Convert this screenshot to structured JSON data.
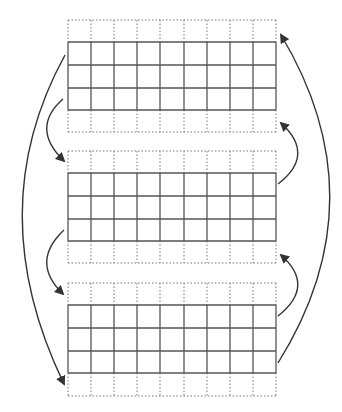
{
  "diagram": {
    "width": 342,
    "height": 412,
    "colors": {
      "background": "#ffffff",
      "solid_line": "#555555",
      "dotted_line": "#777777",
      "arrow": "#333333"
    },
    "grid_columns_x": [
      68,
      91,
      114,
      137,
      160,
      184,
      207,
      230,
      253,
      276
    ],
    "grids": [
      {
        "id": "grid-top",
        "dotted_top": 20,
        "solid_rows_y": [
          42,
          65,
          88,
          110
        ],
        "dotted_bottom": 132
      },
      {
        "id": "grid-middle",
        "dotted_top": 151,
        "solid_rows_y": [
          173,
          196,
          219,
          241
        ],
        "dotted_bottom": 263
      },
      {
        "id": "grid-bottom",
        "dotted_top": 283,
        "solid_rows_y": [
          305,
          328,
          351,
          373
        ],
        "dotted_bottom": 396
      }
    ],
    "arrows": [
      {
        "id": "arrow-left-long",
        "path": "M65,55 Q-20,210 64,384"
      },
      {
        "id": "arrow-left-short-top",
        "path": "M63,99 Q30,128 64,161"
      },
      {
        "id": "arrow-left-short-bottom",
        "path": "M64,230 Q30,262 63,294"
      },
      {
        "id": "arrow-right-long",
        "path": "M278,363 Q380,200 281,35"
      },
      {
        "id": "arrow-right-short-top",
        "path": "M278,184 Q316,155 281,123"
      },
      {
        "id": "arrow-right-short-bottom",
        "path": "M278,316 Q316,286 281,255"
      }
    ]
  }
}
